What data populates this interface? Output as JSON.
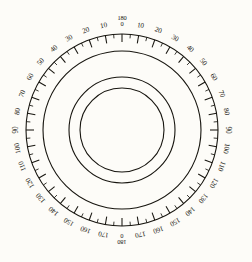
{
  "figure": {
    "name": "protractor-dial",
    "background_color": "#fdfcf8",
    "ink_color": "#17150f",
    "title": ""
  },
  "chart_data": {
    "type": "scatter",
    "subtype": "polar-protractor-dial",
    "title": "",
    "subtitle": "",
    "xlabel": "",
    "ylabel": "",
    "grid": false,
    "legend": null,
    "center": {
      "x": 122,
      "y": 130
    },
    "angular_axis": {
      "name": "bearing-scale",
      "units": "degrees",
      "scale_style": "dual-mirrored-0-180",
      "range": [
        0,
        180
      ],
      "zero_position_top": 0,
      "zero_position_bottom": 0,
      "direction_right_half": "clockwise",
      "direction_left_half": "counterclockwise",
      "minor_tick_interval": 5,
      "major_tick_interval": 10,
      "minor_tick_count": 72,
      "major_tick_count": 36,
      "tick_direction": "inward",
      "minor_tick_length": 4,
      "major_tick_length": 8
    },
    "radial_rings": [
      {
        "name": "outer-graduated-circle",
        "radius": 96,
        "stroke_width": 1.1
      },
      {
        "name": "inner-ring-1",
        "radius": 79,
        "stroke_width": 1.1
      },
      {
        "name": "inner-ring-2",
        "radius": 53,
        "stroke_width": 1.1
      },
      {
        "name": "inner-ring-3",
        "radius": 42,
        "stroke_width": 1.1
      }
    ],
    "labels_right_half": [
      {
        "angle_deg": 0,
        "text": "0",
        "stacked_with": "180"
      },
      {
        "angle_deg": 10,
        "text": "10"
      },
      {
        "angle_deg": 20,
        "text": "20"
      },
      {
        "angle_deg": 30,
        "text": "30"
      },
      {
        "angle_deg": 40,
        "text": "40"
      },
      {
        "angle_deg": 50,
        "text": "50"
      },
      {
        "angle_deg": 60,
        "text": "60"
      },
      {
        "angle_deg": 70,
        "text": "70"
      },
      {
        "angle_deg": 80,
        "text": "80"
      },
      {
        "angle_deg": 90,
        "text": "90"
      },
      {
        "angle_deg": 100,
        "text": "100"
      },
      {
        "angle_deg": 110,
        "text": "110"
      },
      {
        "angle_deg": 120,
        "text": "120"
      },
      {
        "angle_deg": 130,
        "text": "130"
      },
      {
        "angle_deg": 140,
        "text": "140"
      },
      {
        "angle_deg": 150,
        "text": "150"
      },
      {
        "angle_deg": 160,
        "text": "160"
      },
      {
        "angle_deg": 170,
        "text": "170"
      },
      {
        "angle_deg": 180,
        "text": "180",
        "stacked_with": "0"
      }
    ],
    "labels_left_half": [
      {
        "angle_deg": 170,
        "text": "170"
      },
      {
        "angle_deg": 160,
        "text": "160"
      },
      {
        "angle_deg": 150,
        "text": "150"
      },
      {
        "angle_deg": 140,
        "text": "140"
      },
      {
        "angle_deg": 130,
        "text": "130"
      },
      {
        "angle_deg": 120,
        "text": "120"
      },
      {
        "angle_deg": 110,
        "text": "110"
      },
      {
        "angle_deg": 100,
        "text": "100"
      },
      {
        "angle_deg": 90,
        "text": "90"
      },
      {
        "angle_deg": 80,
        "text": "80"
      },
      {
        "angle_deg": 70,
        "text": "70"
      },
      {
        "angle_deg": 60,
        "text": "60"
      },
      {
        "angle_deg": 50,
        "text": "50"
      },
      {
        "angle_deg": 40,
        "text": "40"
      },
      {
        "angle_deg": 30,
        "text": "30"
      },
      {
        "angle_deg": 20,
        "text": "20"
      },
      {
        "angle_deg": 10,
        "text": "10"
      }
    ],
    "top_label_stack": {
      "upper": "180",
      "lower": "0"
    },
    "bottom_label_stack": {
      "upper": "180",
      "lower": "0"
    }
  }
}
